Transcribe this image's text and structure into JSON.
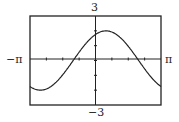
{
  "chart_data": {
    "type": "line",
    "title": "",
    "xlabel": "",
    "ylabel": "",
    "xlim": [
      -3.14159,
      3.14159
    ],
    "ylim": [
      -3,
      3
    ],
    "tick_labels": {
      "x_min": "−π",
      "x_max": "π",
      "y_max": "3",
      "y_min": "−3"
    },
    "grid": false,
    "series": [
      {
        "name": "f(x) = 2cos(x − 0.5)",
        "function": "2*cos(x-0.5)",
        "amplitude": 2,
        "phase_shift": 0.5
      }
    ],
    "x_ticks_count": 8,
    "y_ticks_count": 6
  },
  "labels": {
    "ymax": "3",
    "ymin": "−3",
    "xmin": "−π",
    "xmax": "π"
  }
}
